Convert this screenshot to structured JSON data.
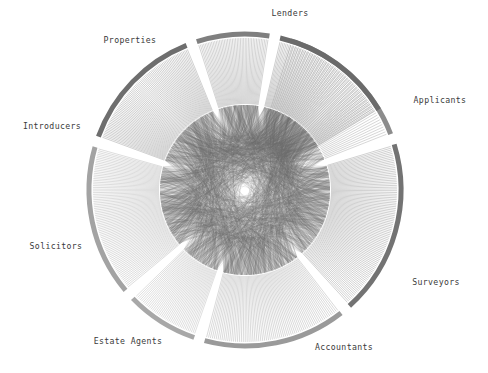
{
  "figure": {
    "type": "hierarchical-edge-bundling",
    "title": "",
    "width": 488,
    "height": 373,
    "background": "#ffffff",
    "center": {
      "x": 245,
      "y": 190
    },
    "hub_radius": 85,
    "spoke_inner_radius": 86,
    "spoke_outer_radius": 152,
    "arc_radius": 156,
    "arc_thickness": 5
  },
  "chart_data": {
    "type": "chord",
    "title": "",
    "xlabel": "",
    "ylabel": "",
    "legend_position": "around-perimeter",
    "grid": false,
    "categories": [
      "Lenders",
      "Applicants",
      "Surveyors",
      "Accountants",
      "Estate Agents",
      "Solicitors",
      "Introducers",
      "Properties"
    ],
    "values": [
      52,
      96,
      72,
      40,
      84,
      80,
      44,
      76
    ],
    "groups": [
      {
        "label": "Lenders",
        "node_count": 52,
        "start_angle": -73,
        "end_angle": -21,
        "arc_color": "#8c8c8c",
        "spoke_color": "#b5b5b5",
        "label_x": 290,
        "label_y": 16,
        "label_anchor": "middle"
      },
      {
        "label": "Applicants",
        "node_count": 96,
        "start_angle": -17,
        "end_angle": 48,
        "arc_color": "#737373",
        "spoke_color": "#ababab",
        "label_x": 440,
        "label_y": 103,
        "label_anchor": "middle"
      },
      {
        "label": "Surveyors",
        "node_count": 72,
        "start_angle": 52,
        "end_angle": 105,
        "arc_color": "#9a9a9a",
        "spoke_color": "#bcbcbc",
        "label_x": 436,
        "label_y": 285,
        "label_anchor": "middle"
      },
      {
        "label": "Accountants",
        "node_count": 40,
        "start_angle": 109,
        "end_angle": 136,
        "arc_color": "#a8a8a8",
        "spoke_color": "#c4c4c4",
        "label_x": 344,
        "label_y": 350,
        "label_anchor": "middle"
      },
      {
        "label": "Estate Agents",
        "node_count": 84,
        "start_angle": 140,
        "end_angle": 196,
        "arc_color": "#a3a3a3",
        "spoke_color": "#c0c0c0",
        "label_x": 128,
        "label_y": 344,
        "label_anchor": "middle"
      },
      {
        "label": "Solicitors",
        "node_count": 80,
        "start_angle": 200,
        "end_angle": 248,
        "arc_color": "#6e6e6e",
        "spoke_color": "#a8a8a8",
        "label_x": 56,
        "label_y": 249,
        "label_anchor": "middle"
      },
      {
        "label": "Introducers",
        "node_count": 44,
        "start_angle": 252,
        "end_angle": 279,
        "arc_color": "#7f7f7f",
        "spoke_color": "#b0b0b0",
        "label_x": 52,
        "label_y": 129,
        "label_anchor": "middle"
      },
      {
        "label": "Properties",
        "node_count": 76,
        "start_angle": 283,
        "end_angle": 329,
        "arc_color": "#6b6b6b",
        "spoke_color": "#a6a6a6",
        "label_x": 130,
        "label_y": 43,
        "label_anchor": "middle"
      }
    ],
    "annotations": []
  },
  "style": {
    "label_color": "#3a3a3a",
    "label_font_size": "8.2px",
    "chord_color": "#6f6f6f",
    "chord_opacity": 0.3,
    "chord_width": 0.35,
    "spoke_width": 0.55,
    "hub_fill": "none"
  },
  "icons": {
    "none": "no-icon"
  }
}
